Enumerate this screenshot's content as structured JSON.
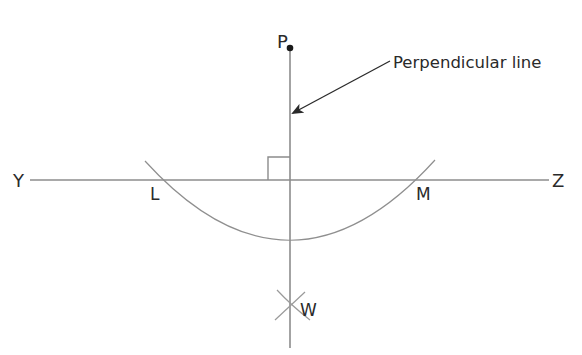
{
  "diagram": {
    "colors": {
      "line": "#8c8c8c",
      "arc": "#8f8f8f",
      "text": "#2a2a2a",
      "point": "#1a1a1a",
      "background": "#ffffff"
    },
    "labels": {
      "point_p": "P",
      "line_end_left": "Y",
      "line_end_right": "Z",
      "intersection_left": "L",
      "intersection_right": "M",
      "arc_intersection": "W",
      "callout": "Perpendicular line"
    },
    "elements": {
      "horizontal_line": {
        "from": [
          30,
          180
        ],
        "to": [
          549,
          180
        ],
        "name": "YZ"
      },
      "perpendicular_line": {
        "from": [
          290,
          48
        ],
        "to": [
          290,
          348
        ],
        "name": "PW"
      },
      "point_p": {
        "x": 290,
        "y": 48
      },
      "right_angle_marker": {
        "x": 268,
        "y": 157,
        "size": 22
      },
      "arc_center": [
        290,
        48
      ],
      "arc_through": [
        "L",
        "M"
      ],
      "intersections": {
        "L": [
          160,
          180
        ],
        "M": [
          421,
          180
        ],
        "W": [
          291,
          303
        ]
      },
      "arrow": {
        "from": [
          390,
          61
        ],
        "to": [
          292,
          114
        ]
      }
    }
  }
}
